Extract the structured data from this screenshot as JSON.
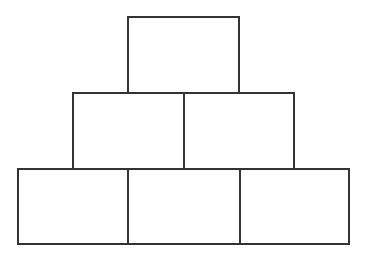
{
  "diagram": {
    "type": "block-pyramid",
    "stroke_color": "#333333",
    "fill_color": "#ffffff",
    "rows": [
      {
        "row": 1,
        "blocks": [
          {
            "x": 127,
            "y": 16,
            "w": 113,
            "h": 77,
            "label": ""
          }
        ]
      },
      {
        "row": 2,
        "blocks": [
          {
            "x": 72,
            "y": 92,
            "w": 112,
            "h": 77,
            "label": ""
          },
          {
            "x": 182,
            "y": 92,
            "w": 112,
            "h": 77,
            "label": ""
          }
        ]
      },
      {
        "row": 3,
        "blocks": [
          {
            "x": 17,
            "y": 168,
            "w": 112,
            "h": 76,
            "label": ""
          },
          {
            "x": 127,
            "y": 168,
            "w": 113,
            "h": 76,
            "label": ""
          },
          {
            "x": 238,
            "y": 168,
            "w": 111,
            "h": 76,
            "label": ""
          }
        ]
      }
    ]
  }
}
